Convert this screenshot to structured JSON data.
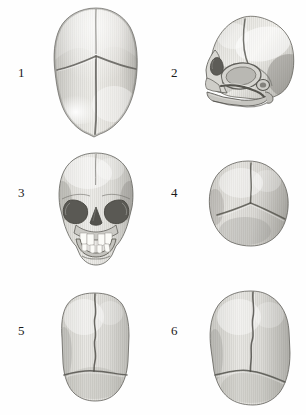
{
  "plate": {
    "background_color": "#fefefe",
    "ink_color": "#1a1a1a",
    "bone_light": "#ececea",
    "bone_mid": "#c9c8c4",
    "bone_dark": "#8e8d88",
    "bone_shadow": "#5f5e5a",
    "tooth_color": "#fbfbf7",
    "layout": "2 columns x 3 rows",
    "style": "grayscale engraving / stipple-hatched anatomical illustration"
  },
  "figures": [
    {
      "number": "1",
      "name": "neonatal-skull-superior-view",
      "caption": "",
      "view": "superior (norma verticalis)",
      "features": "anterior fontanelle, metopic suture, sagittal suture, coronal suture",
      "column": "left",
      "row": 1
    },
    {
      "number": "2",
      "name": "neonatal-skull-lateral-view",
      "caption": "",
      "view": "lateral (norma lateralis)",
      "features": "orbit, zygomatic arch, maxilla, mandible, parietal eminence, squamous suture",
      "column": "right",
      "row": 1
    },
    {
      "number": "3",
      "name": "neonatal-skull-anterior-view",
      "caption": "",
      "view": "anterior (norma frontalis)",
      "features": "orbits, nasal aperture, maxillary and mandibular deciduous teeth, frontal suture",
      "column": "left",
      "row": 2
    },
    {
      "number": "4",
      "name": "neonatal-skull-posterior-view",
      "caption": "",
      "view": "posterior (norma occipitalis)",
      "features": "sagittal suture, lambdoid suture, posterior fontanelle",
      "column": "right",
      "row": 2
    },
    {
      "number": "5",
      "name": "neonatal-skull-superior-elongated-view",
      "caption": "",
      "view": "superior, elongated cranium",
      "features": "sagittal suture, lambdoid suture",
      "column": "left",
      "row": 3
    },
    {
      "number": "6",
      "name": "neonatal-skull-superior-broad-view",
      "caption": "",
      "view": "superior, broad cranium",
      "features": "sagittal suture, lambdoid suture",
      "column": "right",
      "row": 3
    }
  ]
}
